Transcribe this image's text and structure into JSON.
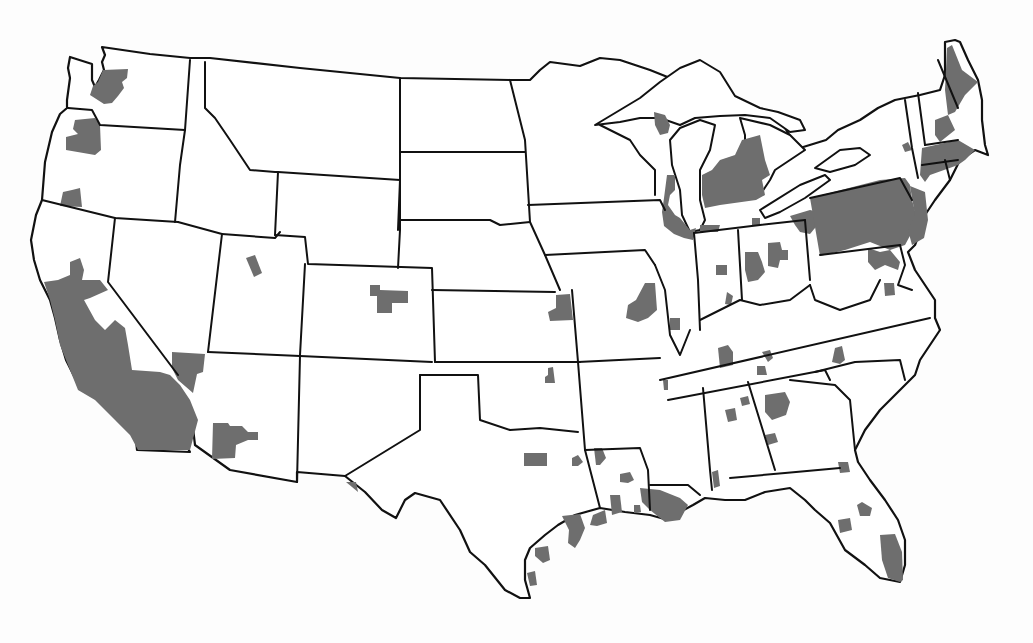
{
  "map": {
    "subject": "Contiguous United States",
    "style": "grayscale choropleth",
    "colors": {
      "background": "#fdfdfd",
      "land": "#ffffff",
      "shaded_region": "#6e6e6e",
      "boundary": "#111111"
    },
    "legend": null,
    "shaded_regions": [
      {
        "name": "seattle-puget-sound",
        "state": "WA"
      },
      {
        "name": "portland",
        "state": "OR"
      },
      {
        "name": "southern-oregon",
        "state": "OR"
      },
      {
        "name": "california-central-and-southern",
        "state": "CA"
      },
      {
        "name": "southern-nevada",
        "state": "NV"
      },
      {
        "name": "phoenix",
        "state": "AZ"
      },
      {
        "name": "salt-lake-area",
        "state": "UT"
      },
      {
        "name": "denver",
        "state": "CO"
      },
      {
        "name": "el-paso",
        "state": "TX"
      },
      {
        "name": "kansas-city",
        "state": "KS/MO"
      },
      {
        "name": "tulsa",
        "state": "OK"
      },
      {
        "name": "dallas-fort-worth",
        "state": "TX"
      },
      {
        "name": "tyler",
        "state": "TX"
      },
      {
        "name": "houston-galveston",
        "state": "TX"
      },
      {
        "name": "beaumont",
        "state": "TX"
      },
      {
        "name": "victoria",
        "state": "TX"
      },
      {
        "name": "corpus-christi",
        "state": "TX"
      },
      {
        "name": "shreveport",
        "state": "LA"
      },
      {
        "name": "alexandria",
        "state": "LA"
      },
      {
        "name": "lake-charles",
        "state": "LA"
      },
      {
        "name": "baton-rouge-new-orleans",
        "state": "LA"
      },
      {
        "name": "st-louis",
        "state": "MO/IL"
      },
      {
        "name": "springfield-il",
        "state": "IL"
      },
      {
        "name": "chicago-milwaukee",
        "state": "IL/WI/IN"
      },
      {
        "name": "green-bay",
        "state": "WI"
      },
      {
        "name": "southern-michigan",
        "state": "MI"
      },
      {
        "name": "indianapolis",
        "state": "IN"
      },
      {
        "name": "evansville-louisville",
        "state": "IN/KY"
      },
      {
        "name": "cincinnati-dayton",
        "state": "OH"
      },
      {
        "name": "columbus",
        "state": "OH"
      },
      {
        "name": "cleveland-toledo",
        "state": "OH"
      },
      {
        "name": "pennsylvania",
        "state": "PA"
      },
      {
        "name": "new-jersey",
        "state": "NJ"
      },
      {
        "name": "maryland-dc",
        "state": "MD"
      },
      {
        "name": "richmond",
        "state": "VA"
      },
      {
        "name": "albany",
        "state": "NY"
      },
      {
        "name": "new-york-city",
        "state": "NY"
      },
      {
        "name": "southern-new-england",
        "state": "CT/RI/MA"
      },
      {
        "name": "new-hampshire",
        "state": "NH"
      },
      {
        "name": "maine",
        "state": "ME"
      },
      {
        "name": "nashville",
        "state": "TN"
      },
      {
        "name": "knoxville",
        "state": "TN"
      },
      {
        "name": "chattanooga",
        "state": "TN"
      },
      {
        "name": "memphis",
        "state": "TN"
      },
      {
        "name": "charlotte",
        "state": "NC"
      },
      {
        "name": "birmingham",
        "state": "AL"
      },
      {
        "name": "gadsden",
        "state": "AL"
      },
      {
        "name": "atlanta",
        "state": "GA"
      },
      {
        "name": "columbus-ga",
        "state": "GA"
      },
      {
        "name": "mobile",
        "state": "AL"
      },
      {
        "name": "jacksonville",
        "state": "FL"
      },
      {
        "name": "orlando",
        "state": "FL"
      },
      {
        "name": "tampa",
        "state": "FL"
      },
      {
        "name": "miami-southeast-florida",
        "state": "FL"
      }
    ]
  }
}
